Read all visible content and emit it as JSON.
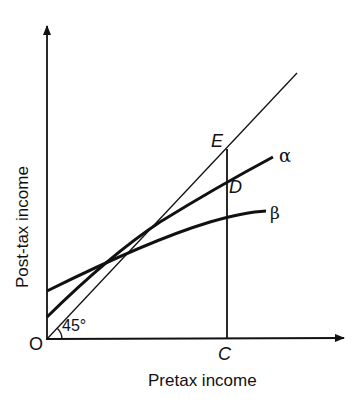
{
  "diagram": {
    "title": "",
    "axes": {
      "x_label": "Pretax income",
      "y_label": "Post-tax income",
      "origin_label": "O"
    },
    "angle_label": "45°",
    "points": {
      "E": "E",
      "D": "D",
      "C": "C"
    },
    "curves": {
      "alpha": "α",
      "beta": "β"
    },
    "colors": {
      "line": "#111111",
      "background": "#ffffff"
    }
  }
}
